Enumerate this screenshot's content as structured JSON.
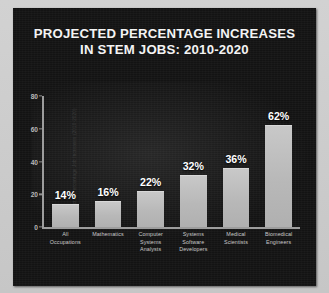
{
  "chart_data": {
    "type": "bar",
    "title": "PROJECTED PERCENTAGE INCREASES IN STEM JOBS: 2010-2020",
    "title_line1": "PROJECTED PERCENTAGE INCREASES",
    "title_line2": "IN STEM JOBS: 2010-2020",
    "xlabel": "",
    "ylabel": "Projected Percentage Job Increases (2010-2020)",
    "ylim": [
      0,
      80
    ],
    "yticks": [
      0,
      20,
      40,
      60,
      80
    ],
    "ytick_labels": [
      "0",
      "20",
      "40",
      "60",
      "80"
    ],
    "grid": false,
    "legend": null,
    "categories": [
      "All Occupations",
      "Mathematics",
      "Computer Systems Analysts",
      "Systems Software Developers",
      "Medical Scientists",
      "Biomedical Engineers"
    ],
    "category_lines": [
      [
        "All",
        "Occupations"
      ],
      [
        "Mathematics"
      ],
      [
        "Computer",
        "Systems",
        "Analysts"
      ],
      [
        "Systems",
        "Software",
        "Developers"
      ],
      [
        "Medical",
        "Scientists"
      ],
      [
        "Biomedical",
        "Engineers"
      ]
    ],
    "values": [
      14,
      16,
      22,
      32,
      36,
      62
    ],
    "value_labels": [
      "14%",
      "16%",
      "22%",
      "32%",
      "36%",
      "62%"
    ],
    "bar_color": "#bcbcbc",
    "background_color": "#131313",
    "text_color": "#f4f4f4",
    "axis_color": "#9d9d9d"
  }
}
